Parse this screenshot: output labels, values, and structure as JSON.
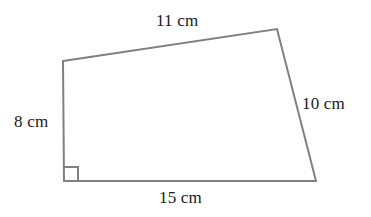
{
  "figure": {
    "type": "quadrilateral-with-right-angle",
    "background_color": "#ffffff",
    "stroke_color": "#808080",
    "stroke_width": 2,
    "text_color": "#1a1a1a",
    "canvas": {
      "width": 371,
      "height": 217
    }
  },
  "shape": {
    "vertices": [
      {
        "name": "top-left",
        "x": 63,
        "y": 61
      },
      {
        "name": "top-right",
        "x": 277,
        "y": 29
      },
      {
        "name": "bottom-right",
        "x": 316,
        "y": 181
      },
      {
        "name": "bottom-left",
        "x": 64,
        "y": 181
      }
    ],
    "points_attr": "63,61 277,29 316,181 64,181",
    "right_angle_marker": {
      "vertex": "bottom-left",
      "size": 14,
      "path": "M 64 167 L 78 167 L 78 181"
    }
  },
  "labels": {
    "top": {
      "text": "11 cm",
      "value": 11,
      "unit": "cm",
      "side": "top"
    },
    "left": {
      "text": "8 cm",
      "value": 8,
      "unit": "cm",
      "side": "left"
    },
    "right": {
      "text": "10 cm",
      "value": 10,
      "unit": "cm",
      "side": "right"
    },
    "bottom": {
      "text": "15 cm",
      "value": 15,
      "unit": "cm",
      "side": "bottom"
    }
  }
}
